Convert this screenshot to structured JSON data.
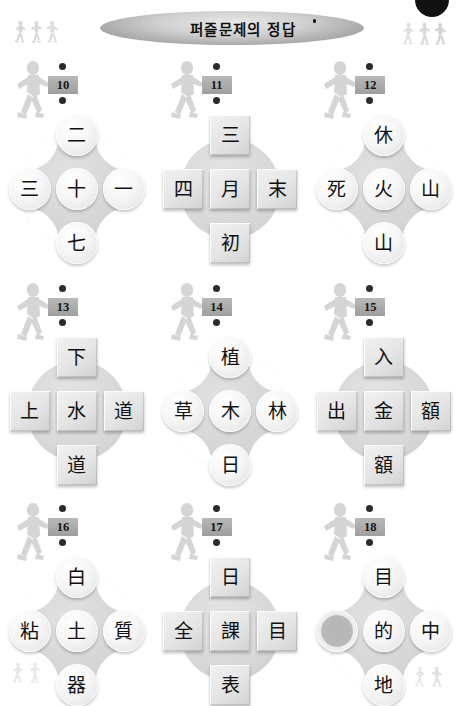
{
  "header": {
    "title": "퍼즐문제의 정답",
    "corner_tab_icon": "page-corner-tab",
    "runner_icon": "runner-figure"
  },
  "puzzles": [
    {
      "number": "10",
      "shape": "circle",
      "nodes": {
        "top": "二",
        "left": "三",
        "center": "十",
        "right": "一",
        "bottom": "七"
      }
    },
    {
      "number": "11",
      "shape": "square",
      "nodes": {
        "top": "三",
        "left": "四",
        "center": "月",
        "right": "末",
        "bottom": "初"
      }
    },
    {
      "number": "12",
      "shape": "circle",
      "nodes": {
        "top": "休",
        "left": "死",
        "center": "火",
        "right": "山",
        "bottom": "山"
      }
    },
    {
      "number": "13",
      "shape": "square",
      "nodes": {
        "top": "下",
        "left": "上",
        "center": "水",
        "right": "道",
        "bottom": "道"
      }
    },
    {
      "number": "14",
      "shape": "circle",
      "nodes": {
        "top": "植",
        "left": "草",
        "center": "木",
        "right": "林",
        "bottom": "日"
      }
    },
    {
      "number": "15",
      "shape": "square",
      "nodes": {
        "top": "入",
        "left": "出",
        "center": "金",
        "right": "額",
        "bottom": "額"
      }
    },
    {
      "number": "16",
      "shape": "circle",
      "nodes": {
        "top": "白",
        "left": "粘",
        "center": "土",
        "right": "質",
        "bottom": "器"
      }
    },
    {
      "number": "17",
      "shape": "square",
      "nodes": {
        "top": "日",
        "left": "全",
        "center": "課",
        "right": "目",
        "bottom": "表"
      }
    },
    {
      "number": "18",
      "shape": "circle",
      "nodes": {
        "top": "目",
        "left": "",
        "center": "的",
        "right": "中",
        "bottom": "地"
      },
      "blank_node": "left"
    }
  ],
  "colors": {
    "page_background": "#ffffff",
    "banner_gray": "#a9a9a9",
    "node_gray": "#e0e0e0",
    "backdrop_gray": "#d8d8d8",
    "badge_gray": "#9e9e9e",
    "text_black": "#101010",
    "corner_tab_black": "#111111"
  }
}
